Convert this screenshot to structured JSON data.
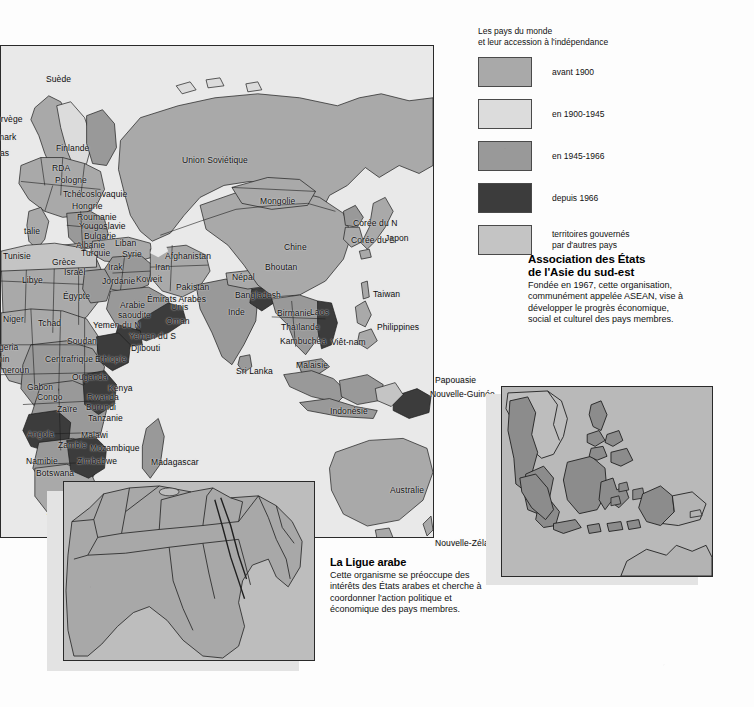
{
  "legend": {
    "title_line1": "Les pays du monde",
    "title_line2": "et leur accession à l'indépendance",
    "items": [
      {
        "label": "avant 1900",
        "color": "#a9a9a9"
      },
      {
        "label": "en 1900-1945",
        "color": "#dcdcdc"
      },
      {
        "label": "en 1945-1966",
        "color": "#999999"
      },
      {
        "label": "depuis 1966",
        "color": "#3c3c3c"
      },
      {
        "label": "territoires gouvernés\npar d'autres pays",
        "color": "#c4c4c4",
        "line1": "territoires gouvernés",
        "line2": "par d'autres pays"
      }
    ]
  },
  "notes": {
    "asean": {
      "title_line1": "Association des États",
      "title_line2": "de l'Asie du sud-est",
      "body": "Fondée en 1967, cette organisation, communément appelée ASEAN, vise à développer le progrès économique, social et culturel des pays membres."
    },
    "ligue": {
      "title": "La Ligue arabe",
      "body": "Cette organisme se préoccupe des intérêts des États arabes et cherche à coordonner l'action politique et économique des pays membres."
    }
  },
  "map_labels": [
    {
      "name": "Suède",
      "x": 46,
      "y": 30,
      "size": "n"
    },
    {
      "name": "orvège",
      "x": -4,
      "y": 70,
      "size": "n"
    },
    {
      "name": "mark",
      "x": -3,
      "y": 88,
      "size": "n"
    },
    {
      "name": "as",
      "x": 0,
      "y": 104,
      "size": "n"
    },
    {
      "name": "Finlande",
      "x": 56,
      "y": 99,
      "size": "n"
    },
    {
      "name": "RDA",
      "x": 52,
      "y": 119,
      "size": "n"
    },
    {
      "name": "Pologne",
      "x": 55,
      "y": 131,
      "size": "n"
    },
    {
      "name": "Tchécoslovaquie",
      "x": 63,
      "y": 145,
      "size": "n"
    },
    {
      "name": "Hongrie",
      "x": 72,
      "y": 157,
      "size": "n"
    },
    {
      "name": "Roumanie",
      "x": 77,
      "y": 168,
      "size": "n"
    },
    {
      "name": "Yougoslavie",
      "x": 79,
      "y": 177,
      "size": "n"
    },
    {
      "name": "Bulgarie",
      "x": 84,
      "y": 187,
      "size": "n"
    },
    {
      "name": "Albanie",
      "x": 76,
      "y": 196,
      "size": "n"
    },
    {
      "name": "Turquie",
      "x": 81,
      "y": 204,
      "size": "n"
    },
    {
      "name": "talie",
      "x": 24,
      "y": 182,
      "size": "n"
    },
    {
      "name": "Grèce",
      "x": 52,
      "y": 213,
      "size": "n"
    },
    {
      "name": "Israël",
      "x": 64,
      "y": 223,
      "size": "n"
    },
    {
      "name": "Liban",
      "x": 115,
      "y": 194,
      "size": "n"
    },
    {
      "name": "Syrie",
      "x": 122,
      "y": 205,
      "size": "n"
    },
    {
      "name": "Irak",
      "x": 108,
      "y": 218,
      "size": "n"
    },
    {
      "name": "Jordanie",
      "x": 102,
      "y": 232,
      "size": "n"
    },
    {
      "name": "Tunisie",
      "x": 3,
      "y": 207,
      "size": "n"
    },
    {
      "name": "Libye",
      "x": 22,
      "y": 231,
      "size": "n"
    },
    {
      "name": "Égypte",
      "x": 63,
      "y": 247,
      "size": "n"
    },
    {
      "name": "Niger",
      "x": 3,
      "y": 270,
      "size": "n"
    },
    {
      "name": "Tchad",
      "x": 38,
      "y": 274,
      "size": "n"
    },
    {
      "name": "igeria",
      "x": -3,
      "y": 298,
      "size": "n"
    },
    {
      "name": "nin",
      "x": -2,
      "y": 310,
      "size": "n"
    },
    {
      "name": "ameroun",
      "x": -5,
      "y": 321,
      "size": "n"
    },
    {
      "name": "Soudan",
      "x": 67,
      "y": 292,
      "size": "n"
    },
    {
      "name": "Centrafrique",
      "x": 45,
      "y": 310,
      "size": "n"
    },
    {
      "name": "Ethiopie",
      "x": 95,
      "y": 310,
      "size": "n"
    },
    {
      "name": "Ouganda",
      "x": 72,
      "y": 328,
      "size": "n"
    },
    {
      "name": "Gabon",
      "x": 27,
      "y": 338,
      "size": "n"
    },
    {
      "name": "Congo",
      "x": 37,
      "y": 348,
      "size": "n"
    },
    {
      "name": "Kenya",
      "x": 108,
      "y": 339,
      "size": "n"
    },
    {
      "name": "Rwanda",
      "x": 87,
      "y": 348,
      "size": "n"
    },
    {
      "name": "Burundi",
      "x": 86,
      "y": 358,
      "size": "n"
    },
    {
      "name": "Zaïre",
      "x": 57,
      "y": 360,
      "size": "n"
    },
    {
      "name": "Tanzanie",
      "x": 88,
      "y": 369,
      "size": "n"
    },
    {
      "name": "Angola",
      "x": 27,
      "y": 385,
      "size": "n"
    },
    {
      "name": "Malawi",
      "x": 81,
      "y": 386,
      "size": "n"
    },
    {
      "name": "Zambie",
      "x": 58,
      "y": 396,
      "size": "n"
    },
    {
      "name": "Mozambique",
      "x": 90,
      "y": 399,
      "size": "n"
    },
    {
      "name": "Namibie",
      "x": 26,
      "y": 412,
      "size": "n"
    },
    {
      "name": "Zimbabwe",
      "x": 77,
      "y": 412,
      "size": "n"
    },
    {
      "name": "Botswana",
      "x": 36,
      "y": 424,
      "size": "n"
    },
    {
      "name": "Madagascar",
      "x": 151,
      "y": 413,
      "size": "n"
    },
    {
      "name": "Swaziland",
      "x": 94,
      "y": 437,
      "size": "n"
    },
    {
      "name": "Lesotho",
      "x": 75,
      "y": 450,
      "size": "n"
    },
    {
      "name": "Afrique du Sud",
      "x": 47,
      "y": 463,
      "size": "n"
    },
    {
      "name": "Arabie",
      "x": 120,
      "y": 256,
      "size": "n"
    },
    {
      "name": "saoudite",
      "x": 118,
      "y": 266,
      "size": "n"
    },
    {
      "name": "Yemen du N",
      "x": 93,
      "y": 276,
      "size": "n"
    },
    {
      "name": "Yemen du S",
      "x": 129,
      "y": 287,
      "size": "n"
    },
    {
      "name": "Djibouti",
      "x": 131,
      "y": 299,
      "size": "n"
    },
    {
      "name": "Koweit",
      "x": 136,
      "y": 230,
      "size": "n"
    },
    {
      "name": "Émirats Arabes",
      "x": 147,
      "y": 250,
      "size": "n"
    },
    {
      "name": "Unis",
      "x": 171,
      "y": 258,
      "size": "n"
    },
    {
      "name": "Oman",
      "x": 166,
      "y": 272,
      "size": "n"
    },
    {
      "name": "Iran",
      "x": 155,
      "y": 218,
      "size": "n"
    },
    {
      "name": "Afghanistan",
      "x": 165,
      "y": 207,
      "size": "n"
    },
    {
      "name": "Pakistan",
      "x": 176,
      "y": 238,
      "size": "n"
    },
    {
      "name": "Union Soviétique",
      "x": 182,
      "y": 111,
      "size": "n"
    },
    {
      "name": "Mongolie",
      "x": 260,
      "y": 152,
      "size": "n"
    },
    {
      "name": "Chine",
      "x": 284,
      "y": 198,
      "size": "n"
    },
    {
      "name": "Népal",
      "x": 232,
      "y": 228,
      "size": "n"
    },
    {
      "name": "Bhoutan",
      "x": 265,
      "y": 218,
      "size": "n"
    },
    {
      "name": "Bangladesh",
      "x": 235,
      "y": 246,
      "size": "n"
    },
    {
      "name": "Inde",
      "x": 228,
      "y": 263,
      "size": "n"
    },
    {
      "name": "Birmanie",
      "x": 277,
      "y": 264,
      "size": "n"
    },
    {
      "name": "Laos",
      "x": 310,
      "y": 263,
      "size": "n"
    },
    {
      "name": "Thaïlande",
      "x": 281,
      "y": 278,
      "size": "n"
    },
    {
      "name": "Kambuchea",
      "x": 280,
      "y": 292,
      "size": "n"
    },
    {
      "name": "Viêt-nam",
      "x": 331,
      "y": 293,
      "size": "n"
    },
    {
      "name": "Malaisie",
      "x": 296,
      "y": 316,
      "size": "n"
    },
    {
      "name": "Indonésie",
      "x": 330,
      "y": 362,
      "size": "n"
    },
    {
      "name": "Sri Lanka",
      "x": 236,
      "y": 322,
      "size": "n"
    },
    {
      "name": "Corée du N",
      "x": 353,
      "y": 174,
      "size": "n"
    },
    {
      "name": "Corée du S",
      "x": 351,
      "y": 191,
      "size": "n"
    },
    {
      "name": "Japon",
      "x": 385,
      "y": 189,
      "size": "n"
    },
    {
      "name": "Taiwan",
      "x": 373,
      "y": 245,
      "size": "n"
    },
    {
      "name": "Philippines",
      "x": 377,
      "y": 278,
      "size": "n"
    },
    {
      "name": "Papouasie",
      "x": 435,
      "y": 331,
      "size": "n"
    },
    {
      "name": "Nouvelle-Guinée",
      "x": 430,
      "y": 345,
      "size": "n"
    },
    {
      "name": "Australie",
      "x": 390,
      "y": 441,
      "size": "n"
    },
    {
      "name": "Nouvelle-Zélande",
      "x": 435,
      "y": 494,
      "size": "n"
    }
  ]
}
